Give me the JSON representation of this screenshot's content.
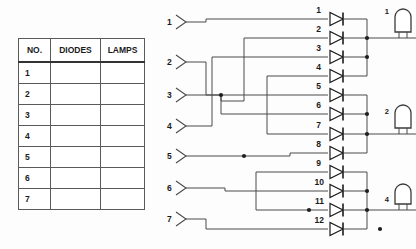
{
  "page": {
    "background_color": "#fdfdfd",
    "wire_color": "#4a4a4a",
    "ink_color": "#1b1b1b"
  },
  "table": {
    "name": "diode-lamp-legend-table",
    "headers": [
      "NO.",
      "DIODES",
      "LAMPS"
    ],
    "rows": [
      {
        "no": "1",
        "diodes": "",
        "lamps": ""
      },
      {
        "no": "2",
        "diodes": "",
        "lamps": ""
      },
      {
        "no": "3",
        "diodes": "",
        "lamps": ""
      },
      {
        "no": "4",
        "diodes": "",
        "lamps": ""
      },
      {
        "no": "5",
        "diodes": "",
        "lamps": ""
      },
      {
        "no": "6",
        "diodes": "",
        "lamps": ""
      },
      {
        "no": "7",
        "diodes": "",
        "lamps": ""
      }
    ]
  },
  "circuit": {
    "inputs": [
      {
        "label": "1",
        "y": 22
      },
      {
        "label": "2",
        "y": 62
      },
      {
        "label": "3",
        "y": 95
      },
      {
        "label": "4",
        "y": 126
      },
      {
        "label": "5",
        "y": 156
      },
      {
        "label": "6",
        "y": 188
      },
      {
        "label": "7",
        "y": 219
      }
    ],
    "diodes": [
      {
        "label": "1",
        "y": 19
      },
      {
        "label": "2",
        "y": 38
      },
      {
        "label": "3",
        "y": 57
      },
      {
        "label": "4",
        "y": 76
      },
      {
        "label": "5",
        "y": 95
      },
      {
        "label": "6",
        "y": 114
      },
      {
        "label": "7",
        "y": 134
      },
      {
        "label": "8",
        "y": 153
      },
      {
        "label": "9",
        "y": 172
      },
      {
        "label": "10",
        "y": 191
      },
      {
        "label": "11",
        "y": 210
      },
      {
        "label": "12",
        "y": 229
      }
    ],
    "lamps": [
      {
        "label": "1",
        "y": 22
      },
      {
        "label": "2",
        "y": 122
      },
      {
        "label": "4",
        "y": 210
      }
    ],
    "junction_count": 12
  }
}
